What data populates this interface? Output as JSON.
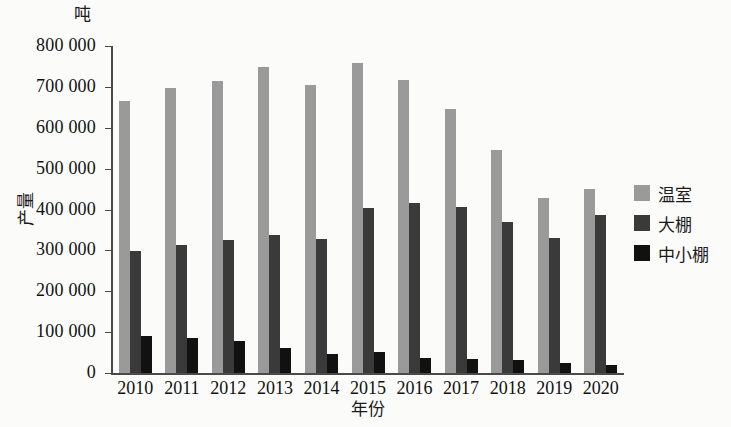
{
  "chart_data": {
    "type": "bar",
    "title": "",
    "unit_label": "吨",
    "xlabel": "年份",
    "ylabel": "产量",
    "categories": [
      "2010",
      "2011",
      "2012",
      "2013",
      "2014",
      "2015",
      "2016",
      "2017",
      "2018",
      "2019",
      "2020"
    ],
    "ylim": [
      0,
      800000
    ],
    "ytick_labels": [
      "800 000",
      "700 000",
      "600 000",
      "500 000",
      "400 000",
      "300 000",
      "200 000",
      "100 000",
      "0"
    ],
    "ytick_values": [
      800000,
      700000,
      600000,
      500000,
      400000,
      300000,
      200000,
      100000,
      0
    ],
    "grid": false,
    "legend_position": "right",
    "series": [
      {
        "name": "温室",
        "color": "#9a9a9a",
        "values": [
          665000,
          697000,
          715000,
          748000,
          705000,
          758000,
          717000,
          645000,
          545000,
          428000,
          450000
        ]
      },
      {
        "name": "大棚",
        "color": "#3a3a3a",
        "values": [
          299000,
          313000,
          325000,
          337000,
          327000,
          403000,
          417000,
          406000,
          370000,
          331000,
          386000
        ]
      },
      {
        "name": "中小棚",
        "color": "#111111",
        "values": [
          90000,
          85000,
          78000,
          62000,
          47000,
          52000,
          37000,
          35000,
          32000,
          24000,
          20000
        ]
      }
    ]
  }
}
